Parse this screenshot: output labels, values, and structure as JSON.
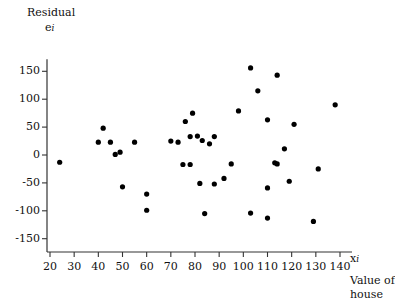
{
  "chart_data": {
    "type": "scatter",
    "title": "",
    "ylabel_line1": "Residual",
    "ylabel_symbol": "e",
    "ylabel_symbol_sub": "i",
    "xlabel_symbol": "x",
    "xlabel_symbol_sub": "i",
    "xlabel_line1": "Value of",
    "xlabel_line2": "house",
    "grid": false,
    "legend": "none",
    "xlim": [
      15,
      145
    ],
    "ylim": [
      -175,
      175
    ],
    "xticks": [
      20,
      30,
      40,
      50,
      60,
      70,
      80,
      90,
      100,
      110,
      120,
      130,
      140
    ],
    "yticks": [
      150,
      100,
      50,
      0,
      -50,
      -100,
      -150
    ],
    "xtick_labels": [
      "20",
      "30",
      "40",
      "50",
      "60",
      "70",
      "80",
      "90",
      "100",
      "110",
      "120",
      "130",
      "140"
    ],
    "ytick_labels": [
      "150",
      "100",
      "50",
      "0",
      "-50",
      "-100",
      "-150"
    ],
    "marker_color": "#000000",
    "axis_color": "#333333",
    "points": [
      {
        "x": 24,
        "y": -13
      },
      {
        "x": 42,
        "y": 48
      },
      {
        "x": 40,
        "y": 23
      },
      {
        "x": 47,
        "y": 1
      },
      {
        "x": 49,
        "y": 5
      },
      {
        "x": 50,
        "y": -57
      },
      {
        "x": 45,
        "y": 23
      },
      {
        "x": 55,
        "y": 23
      },
      {
        "x": 60,
        "y": -70
      },
      {
        "x": 60,
        "y": -99
      },
      {
        "x": 70,
        "y": 25
      },
      {
        "x": 73,
        "y": 23
      },
      {
        "x": 78,
        "y": -17
      },
      {
        "x": 82,
        "y": -51
      },
      {
        "x": 84,
        "y": -105
      },
      {
        "x": 76,
        "y": 60
      },
      {
        "x": 78,
        "y": 33
      },
      {
        "x": 79,
        "y": 75
      },
      {
        "x": 81,
        "y": 34
      },
      {
        "x": 88,
        "y": 33
      },
      {
        "x": 83,
        "y": 26
      },
      {
        "x": 86,
        "y": 20
      },
      {
        "x": 75,
        "y": -17
      },
      {
        "x": 88,
        "y": -52
      },
      {
        "x": 95,
        "y": -16
      },
      {
        "x": 92,
        "y": -42
      },
      {
        "x": 103,
        "y": 156
      },
      {
        "x": 110,
        "y": 63
      },
      {
        "x": 106,
        "y": 115
      },
      {
        "x": 98,
        "y": 79
      },
      {
        "x": 103,
        "y": -104
      },
      {
        "x": 110,
        "y": -113
      },
      {
        "x": 117,
        "y": 11
      },
      {
        "x": 113,
        "y": -14
      },
      {
        "x": 114,
        "y": -16
      },
      {
        "x": 119,
        "y": -47
      },
      {
        "x": 131,
        "y": -25
      },
      {
        "x": 110,
        "y": -59
      },
      {
        "x": 129,
        "y": -119
      },
      {
        "x": 138,
        "y": 90
      },
      {
        "x": 121,
        "y": 55
      },
      {
        "x": 114,
        "y": 143
      }
    ]
  }
}
